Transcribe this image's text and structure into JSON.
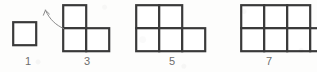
{
  "figure": {
    "background_color": "#fdfdfc",
    "stroke_color": "#3a3a3a",
    "label_color": "#6d6d6d",
    "cell_size": 23,
    "sequence_name": "growing-square-pattern",
    "items": [
      {
        "label": "1",
        "square_count": 1,
        "top_row_squares": 0,
        "bottom_row_squares": 1,
        "origin_x": 13,
        "origin_y": 22,
        "label_x": 18
      },
      {
        "label": "3",
        "square_count": 3,
        "top_row_squares": 1,
        "bottom_row_squares": 2,
        "origin_x": 63,
        "origin_y": 5,
        "label_x": 77
      },
      {
        "label": "5",
        "square_count": 5,
        "top_row_squares": 2,
        "bottom_row_squares": 3,
        "origin_x": 136,
        "origin_y": 5,
        "label_x": 162
      },
      {
        "label": "7",
        "square_count": 7,
        "top_row_squares": 3,
        "bottom_row_squares": 4,
        "origin_x": 241,
        "origin_y": 5,
        "label_x": 259
      }
    ],
    "annotation": {
      "name": "curved-pointer-arrow",
      "color": "#7a7a7a",
      "points_to": "3"
    }
  }
}
